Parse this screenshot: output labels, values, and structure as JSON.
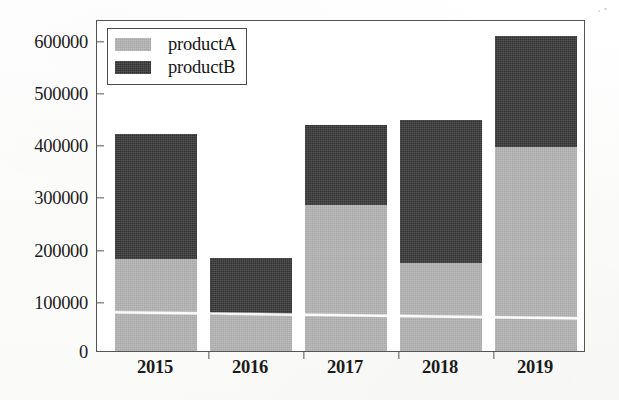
{
  "chart_data": {
    "type": "bar",
    "subtype": "stacked-bar",
    "title": "",
    "xlabel": "",
    "ylabel": "",
    "categories": [
      "2015",
      "2016",
      "2017",
      "2018",
      "2019"
    ],
    "series": [
      {
        "name": "productA",
        "color": "#b5b5b5",
        "values": [
          178000,
          70000,
          283000,
          170000,
          395000
        ]
      },
      {
        "name": "productB",
        "color": "#3b3b3b",
        "values": [
          242000,
          110000,
          155000,
          278000,
          215000
        ]
      }
    ],
    "totals": [
      420000,
      180000,
      438000,
      448000,
      610000
    ],
    "ylim": [
      0,
      640000
    ],
    "yticks": [
      0,
      100000,
      200000,
      300000,
      400000,
      500000,
      600000
    ],
    "ytick_labels": [
      "0",
      "100000",
      "200000",
      "300000",
      "400000",
      "500000",
      "600000"
    ],
    "xtick_labels": [
      "2015",
      "2016",
      "2017",
      "2018",
      "2019"
    ],
    "grid": false,
    "legend": {
      "position": "upper-left",
      "entries": [
        "productA",
        "productB"
      ]
    }
  },
  "legend": {
    "entries": [
      {
        "label": "productA",
        "swatch_name": "legend-swatch-productA"
      },
      {
        "label": "productB",
        "swatch_name": "legend-swatch-productB"
      }
    ]
  },
  "axes": {
    "y_tick_labels": [
      "600000",
      "500000",
      "400000",
      "300000",
      "200000",
      "100000",
      "0"
    ],
    "x_tick_labels": [
      "2015",
      "2016",
      "2017",
      "2018",
      "2019"
    ]
  },
  "colors": {
    "productA": "#b5b5b5",
    "productB": "#3b3b3b",
    "axis": "#555555",
    "text": "#1b1b1b",
    "background": "#ffffff"
  }
}
